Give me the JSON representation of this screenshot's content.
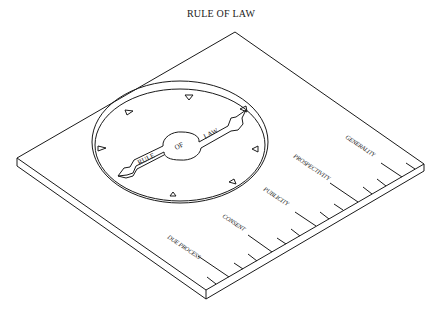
{
  "title": "RULE OF LAW",
  "dial": {
    "pointer_left": "RULE",
    "pointer_hub": "OF",
    "pointer_right": "LAW"
  },
  "scale": {
    "labels": [
      "DUE PROCESS",
      "CONSENT",
      "PUBLICITY",
      "PROSPECTIVITY",
      "GENERALITY"
    ]
  },
  "colors": {
    "ink": "#1a1a1a",
    "background": "#ffffff"
  }
}
